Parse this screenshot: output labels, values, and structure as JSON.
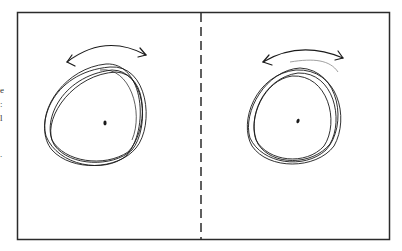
{
  "figure": {
    "panels": [
      {
        "id": "left",
        "arrow": "double-headed-curved-arrow",
        "loops": 4,
        "center_dot": true
      },
      {
        "id": "right",
        "arrow": "double-headed-curved-arrow",
        "loops": 4,
        "center_dot": true
      }
    ],
    "divider": "dashed-vertical-line",
    "edge_text_fragments": [
      "e",
      ":",
      "l",
      "."
    ]
  },
  "colors": {
    "stroke": "#1a1a1a",
    "frame": "#2b2b2b",
    "background": "#ffffff"
  }
}
